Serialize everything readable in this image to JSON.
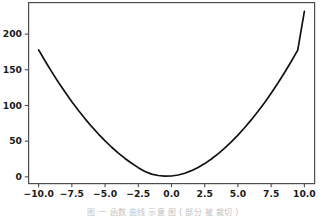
{
  "figure": {
    "background_color": "#ffffff",
    "plot_area": {
      "left": 28,
      "top": 2,
      "right": 315,
      "bottom": 184
    },
    "axis_color": "#4d4d4d",
    "caption_text": "图    一     函数  曲线  示意  图  ( 部分  被  裁切 )"
  },
  "chart_data": {
    "type": "line",
    "title": "",
    "xlabel": "",
    "ylabel": "",
    "xlim": [
      -10.8,
      10.8
    ],
    "ylim": [
      -10,
      245
    ],
    "grid": false,
    "legend": null,
    "line_color": "#111111",
    "line_width": 1.7,
    "xticks": [
      -10.0,
      -7.5,
      -5.0,
      -2.5,
      0.0,
      2.5,
      5.0,
      7.5,
      10.0
    ],
    "xtick_labels": [
      "-10.0",
      "-7.5",
      "-5.0",
      "-2.5",
      "0.0",
      "2.5",
      "5.0",
      "7.5",
      "10.0"
    ],
    "yticks": [
      0,
      50,
      100,
      150,
      200
    ],
    "ytick_labels": [
      "0",
      "50",
      "100",
      "150",
      "200"
    ],
    "series": [
      {
        "name": "quadratic",
        "x": [
          -10.0,
          -9.5,
          -9.0,
          -8.5,
          -8.0,
          -7.5,
          -7.0,
          -6.5,
          -6.0,
          -5.5,
          -5.0,
          -4.5,
          -4.0,
          -3.5,
          -3.0,
          -2.5,
          -2.0,
          -1.5,
          -1.0,
          -0.5,
          0.0,
          0.5,
          1.0,
          1.5,
          2.0,
          2.5,
          3.0,
          3.5,
          4.0,
          4.5,
          5.0,
          5.5,
          6.0,
          6.5,
          7.0,
          7.5,
          8.0,
          8.5,
          9.0,
          9.5,
          10.0
        ],
        "y": [
          178.0,
          162.0,
          146.8,
          132.3,
          118.5,
          105.4,
          93.0,
          81.3,
          70.3,
          60.0,
          50.4,
          41.5,
          33.3,
          25.8,
          19.0,
          12.9,
          7.5,
          3.8,
          1.9,
          1.0,
          1.2,
          2.6,
          5.0,
          8.7,
          13.0,
          18.6,
          25.0,
          32.3,
          40.3,
          49.0,
          58.5,
          68.8,
          79.8,
          91.5,
          104.0,
          117.2,
          131.2,
          145.9,
          161.3,
          177.5,
          232.0
        ]
      }
    ]
  }
}
